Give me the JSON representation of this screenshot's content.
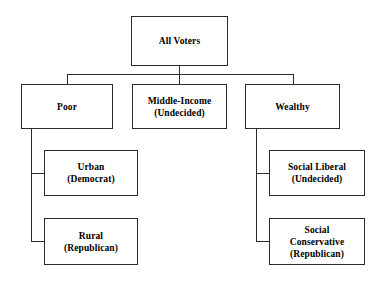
{
  "diagram": {
    "type": "tree",
    "background_color": "#ffffff",
    "border_color": "#2b2b2b",
    "text_color": "#000000",
    "nodes": [
      {
        "id": "all-voters",
        "label": "All Voters",
        "level": 0,
        "parent": null,
        "x": 131,
        "y": 16,
        "w": 97,
        "h": 50
      },
      {
        "id": "poor",
        "label": "Poor",
        "level": 1,
        "parent": "all-voters",
        "x": 21,
        "y": 84,
        "w": 92,
        "h": 45
      },
      {
        "id": "middle-income",
        "label": "Middle-Income\n(Undecided)",
        "level": 1,
        "parent": "all-voters",
        "x": 132,
        "y": 84,
        "w": 95,
        "h": 45
      },
      {
        "id": "wealthy",
        "label": "Wealthy",
        "level": 1,
        "parent": "all-voters",
        "x": 245,
        "y": 84,
        "w": 95,
        "h": 45
      },
      {
        "id": "urban",
        "label": "Urban\n(Democrat)",
        "level": 2,
        "parent": "poor",
        "x": 44,
        "y": 150,
        "w": 94,
        "h": 46
      },
      {
        "id": "rural",
        "label": "Rural\n(Republican)",
        "level": 2,
        "parent": "poor",
        "x": 44,
        "y": 218,
        "w": 94,
        "h": 47
      },
      {
        "id": "social-liberal",
        "label": "Social Liberal\n(Undecided)",
        "level": 2,
        "parent": "wealthy",
        "x": 269,
        "y": 150,
        "w": 96,
        "h": 46
      },
      {
        "id": "social-conservative",
        "label": "Social\nConservative\n(Republican)",
        "level": 2,
        "parent": "wealthy",
        "x": 269,
        "y": 218,
        "w": 96,
        "h": 47
      }
    ],
    "connectors": [
      {
        "id": "root-stem",
        "orient": "v",
        "x": 179,
        "y": 66,
        "len": 9
      },
      {
        "id": "level1-bus",
        "orient": "h",
        "x": 67,
        "y": 74,
        "len": 227
      },
      {
        "id": "drop-poor",
        "orient": "v",
        "x": 67,
        "y": 74,
        "len": 10
      },
      {
        "id": "drop-middle",
        "orient": "v",
        "x": 179,
        "y": 74,
        "len": 10
      },
      {
        "id": "drop-wealthy",
        "orient": "v",
        "x": 293,
        "y": 74,
        "len": 10
      },
      {
        "id": "poor-spine",
        "orient": "v",
        "x": 31,
        "y": 129,
        "len": 113
      },
      {
        "id": "poor-to-urban",
        "orient": "h",
        "x": 31,
        "y": 173,
        "len": 13
      },
      {
        "id": "poor-to-rural",
        "orient": "h",
        "x": 31,
        "y": 241,
        "len": 13
      },
      {
        "id": "wealthy-spine",
        "orient": "v",
        "x": 256,
        "y": 129,
        "len": 113
      },
      {
        "id": "wealthy-to-lib",
        "orient": "h",
        "x": 256,
        "y": 173,
        "len": 13
      },
      {
        "id": "wealthy-to-cons",
        "orient": "h",
        "x": 256,
        "y": 241,
        "len": 13
      }
    ]
  }
}
